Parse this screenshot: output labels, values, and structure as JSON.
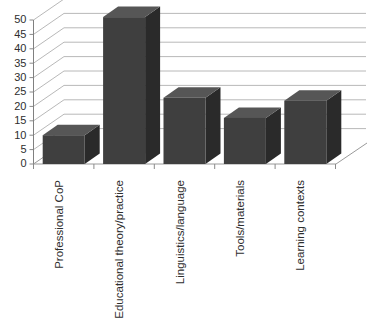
{
  "chart_data": {
    "type": "bar",
    "title": "",
    "subtitle": "",
    "xlabel": "",
    "ylabel": "",
    "categories": [
      "Professional CoP",
      "Educational theory/practice",
      "Linguistics/language",
      "Tools/materials",
      "Learning contexts"
    ],
    "values": [
      10,
      51,
      23,
      16,
      22
    ],
    "ylim": [
      0,
      50
    ],
    "ytick_step": 5,
    "ytick_labels": [
      "0",
      "5",
      "10",
      "15",
      "20",
      "25",
      "30",
      "35",
      "40",
      "45",
      "50"
    ],
    "grid": true,
    "legend": false,
    "legend_position": "none",
    "style": "3d-column",
    "colors": {
      "bar_front": "#3f3f3f",
      "bar_side": "#2a2a2a",
      "bar_top": "#565656",
      "gridline": "#b0b0b0",
      "axis": "#808080",
      "background": "#ffffff",
      "text": "#2e2e2e"
    }
  }
}
